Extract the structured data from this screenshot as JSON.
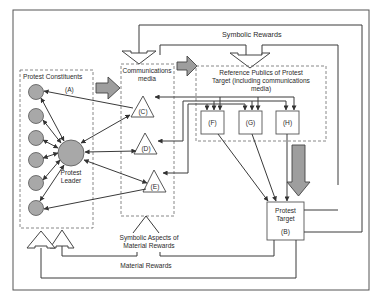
{
  "diagram": {
    "groups": {
      "constituents": {
        "title": "Protest Constituents",
        "id": "(A)"
      },
      "media": {
        "title_line1": "Communications",
        "title_line2": "media"
      },
      "publics": {
        "title_line1": "Reference Publics of Protest",
        "title_line2": "Target (including communications",
        "title_line3": "media)"
      }
    },
    "nodes": {
      "leader": {
        "line1": "Protest",
        "line2": "Leader"
      },
      "target": {
        "line1": "Protest",
        "line2": "Target",
        "id": "(B)"
      },
      "c": "(C)",
      "d": "(D)",
      "e": "(E)",
      "f": "(F)",
      "g": "(G)",
      "h": "(H)"
    },
    "flows": {
      "symbolic_rewards": "Symbolic Rewards",
      "symbolic_aspects_line1": "Symbolic Aspects of",
      "symbolic_aspects_line2": "Material Rewards",
      "material_rewards": "Material Rewards"
    },
    "colors": {
      "node_fill": "#a8a8a8",
      "fat_arrow_fill": "#9e9e9e",
      "line": "#3a3a3a"
    }
  }
}
